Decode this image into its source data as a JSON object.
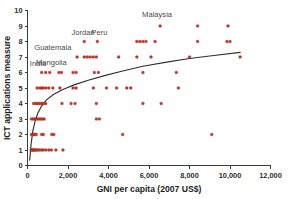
{
  "chart_data": {
    "type": "scatter",
    "title": "",
    "xlabel": "GNI per capita (2007  US$)",
    "ylabel": "ICT applications measure",
    "xlim": [
      0,
      12000
    ],
    "ylim": [
      0,
      10
    ],
    "xticks": [
      0,
      2000,
      4000,
      6000,
      8000,
      10000,
      12000
    ],
    "xticklabels": [
      "0",
      "2,000",
      "4,000",
      "6,000",
      "8,000",
      "10,000",
      "12,000"
    ],
    "yticks": [
      0,
      1,
      2,
      3,
      4,
      5,
      6,
      7,
      8,
      9,
      10
    ],
    "yticklabels": [
      "0",
      "1",
      "2",
      "3",
      "4",
      "5",
      "6",
      "7",
      "8",
      "9",
      "10"
    ],
    "grid": false,
    "legend": "none",
    "marker_color": "#c0392b",
    "trend_color": "#2f2f2f",
    "points": [
      {
        "x": 180,
        "y": 1
      },
      {
        "x": 230,
        "y": 1
      },
      {
        "x": 260,
        "y": 1
      },
      {
        "x": 300,
        "y": 1
      },
      {
        "x": 340,
        "y": 1
      },
      {
        "x": 400,
        "y": 1
      },
      {
        "x": 450,
        "y": 1
      },
      {
        "x": 520,
        "y": 1
      },
      {
        "x": 600,
        "y": 1
      },
      {
        "x": 700,
        "y": 1
      },
      {
        "x": 780,
        "y": 1
      },
      {
        "x": 900,
        "y": 1
      },
      {
        "x": 1050,
        "y": 1
      },
      {
        "x": 1180,
        "y": 1
      },
      {
        "x": 1400,
        "y": 1
      },
      {
        "x": 1750,
        "y": 1
      },
      {
        "x": 200,
        "y": 2
      },
      {
        "x": 260,
        "y": 2
      },
      {
        "x": 320,
        "y": 2
      },
      {
        "x": 380,
        "y": 2
      },
      {
        "x": 430,
        "y": 2
      },
      {
        "x": 700,
        "y": 2
      },
      {
        "x": 780,
        "y": 2
      },
      {
        "x": 1200,
        "y": 2
      },
      {
        "x": 1300,
        "y": 2
      },
      {
        "x": 4700,
        "y": 2
      },
      {
        "x": 9100,
        "y": 2
      },
      {
        "x": 200,
        "y": 3
      },
      {
        "x": 280,
        "y": 3
      },
      {
        "x": 360,
        "y": 3
      },
      {
        "x": 420,
        "y": 3
      },
      {
        "x": 500,
        "y": 3
      },
      {
        "x": 580,
        "y": 3
      },
      {
        "x": 660,
        "y": 3
      },
      {
        "x": 740,
        "y": 3
      },
      {
        "x": 820,
        "y": 3
      },
      {
        "x": 3400,
        "y": 3
      },
      {
        "x": 3550,
        "y": 3
      },
      {
        "x": 300,
        "y": 4
      },
      {
        "x": 400,
        "y": 4
      },
      {
        "x": 480,
        "y": 4
      },
      {
        "x": 560,
        "y": 4
      },
      {
        "x": 640,
        "y": 4
      },
      {
        "x": 720,
        "y": 4
      },
      {
        "x": 800,
        "y": 4
      },
      {
        "x": 900,
        "y": 4
      },
      {
        "x": 1700,
        "y": 4
      },
      {
        "x": 2150,
        "y": 4
      },
      {
        "x": 2350,
        "y": 4
      },
      {
        "x": 3400,
        "y": 4
      },
      {
        "x": 5700,
        "y": 4
      },
      {
        "x": 6600,
        "y": 4
      },
      {
        "x": 480,
        "y": 5
      },
      {
        "x": 620,
        "y": 5
      },
      {
        "x": 700,
        "y": 5
      },
      {
        "x": 780,
        "y": 5
      },
      {
        "x": 900,
        "y": 5
      },
      {
        "x": 1050,
        "y": 5
      },
      {
        "x": 1250,
        "y": 5
      },
      {
        "x": 1600,
        "y": 5
      },
      {
        "x": 2250,
        "y": 5
      },
      {
        "x": 2400,
        "y": 5
      },
      {
        "x": 3250,
        "y": 5
      },
      {
        "x": 3900,
        "y": 5
      },
      {
        "x": 4400,
        "y": 5
      },
      {
        "x": 4900,
        "y": 5
      },
      {
        "x": 5100,
        "y": 5
      },
      {
        "x": 7450,
        "y": 5
      },
      {
        "x": 700,
        "y": 6
      },
      {
        "x": 900,
        "y": 6
      },
      {
        "x": 1100,
        "y": 6
      },
      {
        "x": 1550,
        "y": 6
      },
      {
        "x": 1680,
        "y": 6
      },
      {
        "x": 2250,
        "y": 6
      },
      {
        "x": 2400,
        "y": 6
      },
      {
        "x": 3300,
        "y": 6
      },
      {
        "x": 3500,
        "y": 6
      },
      {
        "x": 5700,
        "y": 6
      },
      {
        "x": 7350,
        "y": 6
      },
      {
        "x": 2450,
        "y": 7
      },
      {
        "x": 2800,
        "y": 7
      },
      {
        "x": 2950,
        "y": 7
      },
      {
        "x": 3100,
        "y": 7
      },
      {
        "x": 3250,
        "y": 7
      },
      {
        "x": 3400,
        "y": 7
      },
      {
        "x": 4500,
        "y": 7
      },
      {
        "x": 5400,
        "y": 7
      },
      {
        "x": 6100,
        "y": 7
      },
      {
        "x": 8000,
        "y": 7
      },
      {
        "x": 10500,
        "y": 7
      },
      {
        "x": 2800,
        "y": 8
      },
      {
        "x": 3450,
        "y": 8
      },
      {
        "x": 5400,
        "y": 8
      },
      {
        "x": 5550,
        "y": 8
      },
      {
        "x": 5700,
        "y": 8
      },
      {
        "x": 5850,
        "y": 8
      },
      {
        "x": 6300,
        "y": 8
      },
      {
        "x": 8400,
        "y": 8
      },
      {
        "x": 9850,
        "y": 8
      },
      {
        "x": 10000,
        "y": 8
      },
      {
        "x": 6550,
        "y": 9
      },
      {
        "x": 8400,
        "y": 9
      },
      {
        "x": 9900,
        "y": 9
      }
    ],
    "trend_line": {
      "description": "logarithmic fit curve rising from near 0 at low GNI to about 7.3 at 10,500 US$",
      "points": [
        {
          "x": 110,
          "y": 0.35
        },
        {
          "x": 180,
          "y": 1.4
        },
        {
          "x": 260,
          "y": 2.2
        },
        {
          "x": 380,
          "y": 2.9
        },
        {
          "x": 520,
          "y": 3.4
        },
        {
          "x": 700,
          "y": 3.85
        },
        {
          "x": 950,
          "y": 4.25
        },
        {
          "x": 1300,
          "y": 4.6
        },
        {
          "x": 1750,
          "y": 4.9
        },
        {
          "x": 2300,
          "y": 5.2
        },
        {
          "x": 3000,
          "y": 5.5
        },
        {
          "x": 3800,
          "y": 5.8
        },
        {
          "x": 4700,
          "y": 6.1
        },
        {
          "x": 5700,
          "y": 6.4
        },
        {
          "x": 6800,
          "y": 6.65
        },
        {
          "x": 8000,
          "y": 6.9
        },
        {
          "x": 9200,
          "y": 7.1
        },
        {
          "x": 10500,
          "y": 7.3
        }
      ]
    },
    "annotations": [
      {
        "label": "India",
        "x": 520,
        "y": 6.45
      },
      {
        "label": "Mongolia",
        "x": 1180,
        "y": 6.5
      },
      {
        "label": "Guatemala",
        "x": 1250,
        "y": 7.45
      },
      {
        "label": "Jordan",
        "x": 2750,
        "y": 8.45
      },
      {
        "label": "Peru",
        "x": 3550,
        "y": 8.45
      },
      {
        "label": "Malaysia",
        "x": 6400,
        "y": 9.6
      }
    ]
  }
}
